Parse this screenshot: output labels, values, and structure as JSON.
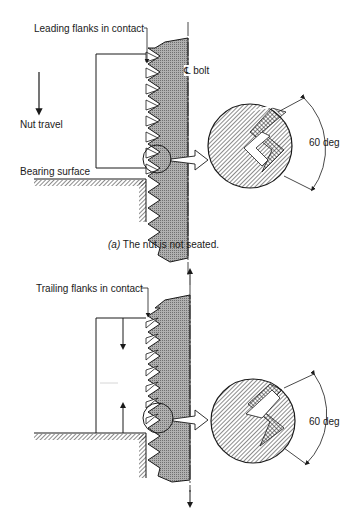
{
  "figure_a": {
    "labels": {
      "leading_flanks": "Leading flanks in contact",
      "centerline_bolt": "℄ bolt",
      "nut_travel": "Nut travel",
      "bearing_surface": "Bearing surface",
      "angle": "60 deg"
    },
    "caption": {
      "letter": "(a)",
      "text": "The nut is not seated."
    }
  },
  "figure_b": {
    "labels": {
      "trailing_flanks": "Trailing flanks in contact",
      "angle": "60 deg"
    }
  },
  "colors": {
    "ink": "#1a1a1a",
    "bolt_fill": "#9a9a9a",
    "background": "#ffffff"
  }
}
